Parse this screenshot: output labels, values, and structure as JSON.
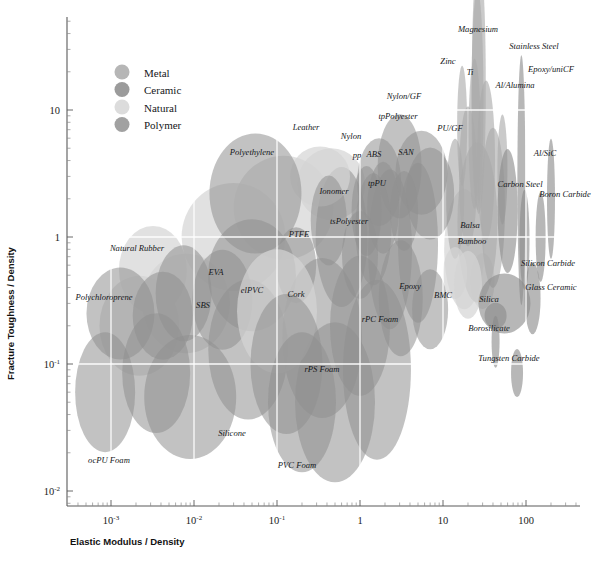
{
  "chart_data": {
    "type": "scatter",
    "title": "",
    "xlabel": "Elastic Modulus / Density",
    "ylabel": "Fracture Toughness / Density",
    "xscale": "log",
    "yscale": "log",
    "xlim": [
      0.0003,
      400
    ],
    "ylim": [
      0.006,
      45
    ],
    "grid": true,
    "grid_color": "#ffffff",
    "legend_position": "top-left",
    "xticks": [
      {
        "value": 0.001,
        "label": "10",
        "exp": "-3"
      },
      {
        "value": 0.01,
        "label": "10",
        "exp": "-2"
      },
      {
        "value": 0.1,
        "label": "10",
        "exp": "-1"
      },
      {
        "value": 1,
        "label": "1",
        "exp": ""
      },
      {
        "value": 10,
        "label": "10",
        "exp": ""
      },
      {
        "value": 100,
        "label": "100",
        "exp": ""
      }
    ],
    "yticks": [
      {
        "value": 0.01,
        "label": "10",
        "exp": "-2"
      },
      {
        "value": 0.1,
        "label": "10",
        "exp": "-1"
      },
      {
        "value": 1,
        "label": "1",
        "exp": ""
      },
      {
        "value": 10,
        "label": "10",
        "exp": ""
      }
    ],
    "legend": [
      {
        "name": "Metal",
        "color": "#a9a9a9"
      },
      {
        "name": "Ceramic",
        "color": "#8a8a8a"
      },
      {
        "name": "Natural",
        "color": "#d6d6d6"
      },
      {
        "name": "Polymer",
        "color": "#909090"
      }
    ],
    "families": {
      "Metal": {
        "fill": "#a9a9a9",
        "opacity": 0.62
      },
      "Ceramic": {
        "fill": "#8a8a8a",
        "opacity": 0.62
      },
      "Natural": {
        "fill": "#d4d4d4",
        "opacity": 0.7
      },
      "Polymer": {
        "fill": "#909090",
        "opacity": 0.55
      }
    },
    "points": [
      {
        "label": "Magnesium",
        "family": "Metal",
        "x": 27,
        "y": 16,
        "rx": 7,
        "ry": 130,
        "rot": 0,
        "lx": 478,
        "ly": 32,
        "anchor": "middle"
      },
      {
        "label": "Stainless Steel",
        "family": "Metal",
        "x": 26,
        "y": 12,
        "rx": 6,
        "ry": 110,
        "rot": 0,
        "lx": 534,
        "ly": 49,
        "anchor": "middle"
      },
      {
        "label": "Zinc",
        "family": "Metal",
        "x": 17,
        "y": 7.5,
        "rx": 5,
        "ry": 60,
        "rot": 0,
        "lx": 448,
        "ly": 64,
        "anchor": "middle"
      },
      {
        "label": "Ti",
        "family": "Metal",
        "x": 24,
        "y": 6.5,
        "rx": 6,
        "ry": 75,
        "rot": 0,
        "lx": 470,
        "ly": 75,
        "anchor": "middle"
      },
      {
        "label": "Epoxy/uniCF",
        "family": "Ceramic",
        "x": 88,
        "y": 2.8,
        "rx": 4,
        "ry": 125,
        "rot": 0,
        "lx": 551,
        "ly": 72,
        "anchor": "middle"
      },
      {
        "label": "Al/Alumina",
        "family": "Metal",
        "x": 52,
        "y": 3.4,
        "rx": 5,
        "ry": 55,
        "rot": 0,
        "lx": 515,
        "ly": 88,
        "anchor": "middle"
      },
      {
        "label": "Nylon/GF",
        "family": "Polymer",
        "x": 5.5,
        "y": 3.2,
        "rx": 26,
        "ry": 42,
        "rot": 0,
        "lx": 404,
        "ly": 99,
        "anchor": "middle"
      },
      {
        "label": "tpPolyester",
        "family": "Polymer",
        "x": 3.0,
        "y": 3.6,
        "rx": 22,
        "ry": 52,
        "rot": 0,
        "lx": 398,
        "ly": 119,
        "anchor": "middle"
      },
      {
        "label": "PU/GF",
        "family": "Polymer",
        "x": 7.0,
        "y": 2.2,
        "rx": 24,
        "ry": 46,
        "rot": 0,
        "lx": 450,
        "ly": 131,
        "anchor": "middle"
      },
      {
        "label": "Al/SiC",
        "family": "Ceramic",
        "x": 60,
        "y": 1.6,
        "rx": 10,
        "ry": 62,
        "rot": 0,
        "lx": 545,
        "ly": 156,
        "anchor": "middle"
      },
      {
        "label": "Nylon",
        "family": "Polymer",
        "x": 1.7,
        "y": 2.7,
        "rx": 22,
        "ry": 44,
        "rot": 0,
        "lx": 351,
        "ly": 139,
        "anchor": "middle"
      },
      {
        "label": "Leather",
        "family": "Natural",
        "x": 0.33,
        "y": 3.0,
        "rx": 30,
        "ry": 30,
        "rot": 0,
        "lx": 306,
        "ly": 130,
        "anchor": "middle"
      },
      {
        "label": "Polyethylene",
        "family": "Polymer",
        "x": 0.055,
        "y": 2.2,
        "rx": 46,
        "ry": 60,
        "rot": 0,
        "lx": 252,
        "ly": 155,
        "anchor": "middle"
      },
      {
        "label": "SAN",
        "family": "Polymer",
        "x": 3.4,
        "y": 1.6,
        "rx": 14,
        "ry": 40,
        "rot": 0,
        "lx": 406,
        "ly": 155,
        "anchor": "middle"
      },
      {
        "label": "ABS",
        "family": "Polymer",
        "x": 1.9,
        "y": 1.7,
        "rx": 16,
        "ry": 46,
        "rot": 0,
        "lx": 374,
        "ly": 157,
        "anchor": "middle"
      },
      {
        "label": "pp",
        "family": "Polymer",
        "x": 1.2,
        "y": 1.6,
        "rx": 15,
        "ry": 45,
        "rot": 0,
        "lx": 357,
        "ly": 158,
        "anchor": "middle"
      },
      {
        "label": "Carbon Steel",
        "family": "Metal",
        "x": 26,
        "y": 1.3,
        "rx": 20,
        "ry": 80,
        "rot": 0,
        "lx": 520,
        "ly": 187,
        "anchor": "middle"
      },
      {
        "label": "Boron Carbide",
        "family": "Ceramic",
        "x": 96,
        "y": 0.95,
        "rx": 5,
        "ry": 50,
        "rot": 0,
        "lx": 565,
        "ly": 197,
        "anchor": "middle"
      },
      {
        "label": "Ionomer",
        "family": "Polymer",
        "x": 0.42,
        "y": 1.35,
        "rx": 18,
        "ry": 45,
        "rot": 0,
        "lx": 334,
        "ly": 194,
        "anchor": "middle"
      },
      {
        "label": "tpPU",
        "family": "Polymer",
        "x": 1.45,
        "y": 1.15,
        "rx": 18,
        "ry": 56,
        "rot": 0,
        "lx": 377,
        "ly": 186,
        "anchor": "middle"
      },
      {
        "label": "tsPolyester",
        "family": "Polymer",
        "x": 1.0,
        "y": 0.72,
        "rx": 18,
        "ry": 44,
        "rot": 0,
        "lx": 349,
        "ly": 224,
        "anchor": "middle"
      },
      {
        "label": "Balsa",
        "family": "Natural",
        "x": 14,
        "y": 0.52,
        "rx": 12,
        "ry": 26,
        "rot": 0,
        "lx": 470,
        "ly": 228,
        "anchor": "middle"
      },
      {
        "label": "PTFE",
        "family": "Polymer",
        "x": 0.17,
        "y": 0.6,
        "rx": 20,
        "ry": 38,
        "rot": 0,
        "lx": 299,
        "ly": 237,
        "anchor": "middle"
      },
      {
        "label": "Bamboo",
        "family": "Natural",
        "x": 20,
        "y": 0.42,
        "rx": 14,
        "ry": 34,
        "rot": 0,
        "lx": 472,
        "ly": 244,
        "anchor": "middle"
      },
      {
        "label": "Natural Rubber",
        "family": "Natural",
        "x": 0.0032,
        "y": 0.55,
        "rx": 34,
        "ry": 44,
        "rot": 0,
        "lx": 137,
        "ly": 251,
        "anchor": "middle"
      },
      {
        "label": "Silicon Carbide",
        "family": "Ceramic",
        "x": 120,
        "y": 0.33,
        "rx": 8,
        "ry": 36,
        "rot": 0,
        "lx": 548,
        "ly": 266,
        "anchor": "middle"
      },
      {
        "label": "EVA",
        "family": "Polymer",
        "x": 0.0075,
        "y": 0.36,
        "rx": 28,
        "ry": 48,
        "rot": 0,
        "lx": 216,
        "ly": 275,
        "anchor": "middle"
      },
      {
        "label": "elPVC",
        "family": "Polymer",
        "x": 0.022,
        "y": 0.32,
        "rx": 30,
        "ry": 50,
        "rot": 0,
        "lx": 252,
        "ly": 293,
        "anchor": "middle"
      },
      {
        "label": "Glass Ceramic",
        "family": "Ceramic",
        "x": 55,
        "y": 0.3,
        "rx": 26,
        "ry": 30,
        "rot": 0,
        "lx": 551,
        "ly": 290,
        "anchor": "middle"
      },
      {
        "label": "Cork",
        "family": "Natural",
        "x": 0.1,
        "y": 0.26,
        "rx": 40,
        "ry": 62,
        "rot": 0,
        "lx": 296,
        "ly": 297,
        "anchor": "middle"
      },
      {
        "label": "Polychloroprene",
        "family": "Polymer",
        "x": 0.0013,
        "y": 0.25,
        "rx": 34,
        "ry": 46,
        "rot": 0,
        "lx": 104,
        "ly": 300,
        "anchor": "middle"
      },
      {
        "label": "SBS",
        "family": "Polymer",
        "x": 0.0042,
        "y": 0.24,
        "rx": 30,
        "ry": 44,
        "rot": 0,
        "lx": 203,
        "ly": 308,
        "anchor": "middle"
      },
      {
        "label": "Epoxy",
        "family": "Polymer",
        "x": 3.1,
        "y": 0.33,
        "rx": 22,
        "ry": 58,
        "rot": 0,
        "lx": 410,
        "ly": 289,
        "anchor": "middle"
      },
      {
        "label": "BMC",
        "family": "Polymer",
        "x": 7.0,
        "y": 0.27,
        "rx": 18,
        "ry": 40,
        "rot": 0,
        "lx": 443,
        "ly": 298,
        "anchor": "middle"
      },
      {
        "label": "Silica",
        "family": "Ceramic",
        "x": 43,
        "y": 0.24,
        "rx": 11,
        "ry": 13,
        "rot": 0,
        "lx": 489,
        "ly": 302,
        "anchor": "middle"
      },
      {
        "label": "rPC Foam",
        "family": "Polymer",
        "x": 1.0,
        "y": 0.2,
        "rx": 30,
        "ry": 70,
        "rot": 0,
        "lx": 380,
        "ly": 322,
        "anchor": "middle"
      },
      {
        "label": "Borosilicate",
        "family": "Ceramic",
        "x": 43,
        "y": 0.15,
        "rx": 4,
        "ry": 26,
        "rot": 0,
        "lx": 489,
        "ly": 331,
        "anchor": "middle"
      },
      {
        "label": "rPS Foam",
        "family": "Polymer",
        "x": 0.13,
        "y": 0.1,
        "rx": 36,
        "ry": 70,
        "rot": 0,
        "lx": 322,
        "ly": 372,
        "anchor": "middle"
      },
      {
        "label": "Tungsten Carbide",
        "family": "Ceramic",
        "x": 78,
        "y": 0.085,
        "rx": 6,
        "ry": 24,
        "rot": 0,
        "lx": 509,
        "ly": 361,
        "anchor": "middle"
      },
      {
        "label": "Silicone",
        "family": "Polymer",
        "x": 0.009,
        "y": 0.055,
        "rx": 46,
        "ry": 62,
        "rot": 0,
        "lx": 232,
        "ly": 436,
        "anchor": "middle"
      },
      {
        "label": "ocPU Foam",
        "family": "Polymer",
        "x": 0.00085,
        "y": 0.06,
        "rx": 30,
        "ry": 60,
        "rot": 0,
        "lx": 109,
        "ly": 463,
        "anchor": "middle"
      },
      {
        "label": "PVC Foam",
        "family": "Polymer",
        "x": 0.2,
        "y": 0.05,
        "rx": 34,
        "ry": 70,
        "rot": 0,
        "lx": 297,
        "ly": 468,
        "anchor": "middle"
      }
    ],
    "background_bubbles": [
      {
        "family": "Natural",
        "x": 0.45,
        "y": 2.6,
        "rx": 34,
        "ry": 36,
        "rot": 0
      },
      {
        "family": "Natural",
        "x": 0.12,
        "y": 1.7,
        "rx": 50,
        "ry": 52,
        "rot": 0
      },
      {
        "family": "Natural",
        "x": 0.03,
        "y": 1.0,
        "rx": 52,
        "ry": 54,
        "rot": 0
      },
      {
        "family": "Natural",
        "x": 18,
        "y": 0.8,
        "rx": 20,
        "ry": 60,
        "rot": 0
      },
      {
        "family": "Natural",
        "x": 30,
        "y": 0.45,
        "rx": 12,
        "ry": 28,
        "rot": 0
      },
      {
        "family": "Natural",
        "x": 0.008,
        "y": 0.3,
        "rx": 44,
        "ry": 50,
        "rot": 0
      },
      {
        "family": "Natural",
        "x": 0.0022,
        "y": 0.2,
        "rx": 40,
        "ry": 50,
        "rot": 0
      },
      {
        "family": "Metal",
        "x": 33,
        "y": 4.0,
        "rx": 9,
        "ry": 80,
        "rot": 0
      },
      {
        "family": "Metal",
        "x": 20,
        "y": 3.0,
        "rx": 9,
        "ry": 70,
        "rot": 0
      },
      {
        "family": "Metal",
        "x": 40,
        "y": 1.7,
        "rx": 12,
        "ry": 80,
        "rot": 0
      },
      {
        "family": "Metal",
        "x": 14,
        "y": 2.0,
        "rx": 9,
        "ry": 60,
        "rot": 0
      },
      {
        "family": "Ceramic",
        "x": 150,
        "y": 1.0,
        "rx": 5,
        "ry": 45,
        "rot": 0
      },
      {
        "family": "Ceramic",
        "x": 200,
        "y": 2.0,
        "rx": 4,
        "ry": 60,
        "rot": 0
      },
      {
        "family": "Polymer",
        "x": 0.6,
        "y": 1.0,
        "rx": 26,
        "ry": 70,
        "rot": 0
      },
      {
        "family": "Polymer",
        "x": 2.3,
        "y": 0.8,
        "rx": 22,
        "ry": 80,
        "rot": 0
      },
      {
        "family": "Polymer",
        "x": 5.0,
        "y": 0.9,
        "rx": 20,
        "ry": 80,
        "rot": 0
      },
      {
        "family": "Polymer",
        "x": 0.05,
        "y": 0.5,
        "rx": 44,
        "ry": 56,
        "rot": 0
      },
      {
        "family": "Polymer",
        "x": 0.35,
        "y": 0.16,
        "rx": 40,
        "ry": 80,
        "rot": 0
      },
      {
        "family": "Polymer",
        "x": 0.045,
        "y": 0.13,
        "rx": 40,
        "ry": 70,
        "rot": 0
      },
      {
        "family": "Polymer",
        "x": 0.0035,
        "y": 0.085,
        "rx": 34,
        "ry": 60,
        "rot": 0
      },
      {
        "family": "Polymer",
        "x": 1.6,
        "y": 0.09,
        "rx": 34,
        "ry": 90,
        "rot": 0
      },
      {
        "family": "Polymer",
        "x": 0.5,
        "y": 0.05,
        "rx": 40,
        "ry": 80,
        "rot": 0
      }
    ]
  }
}
